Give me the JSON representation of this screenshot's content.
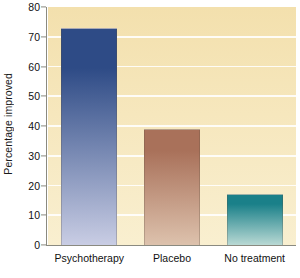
{
  "chart_data": {
    "type": "bar",
    "title": "",
    "xlabel": "",
    "ylabel": "Percentage improved",
    "categories": [
      "Psychotherapy",
      "Placebo",
      "No treatment"
    ],
    "values": [
      73,
      39,
      17
    ],
    "series": [
      {
        "name": "Percentage improved",
        "values": [
          73,
          39,
          17
        ]
      }
    ],
    "ylim": [
      0,
      80
    ],
    "ytick_labels": [
      "0",
      "10",
      "20",
      "30",
      "40",
      "50",
      "60",
      "70",
      "80"
    ],
    "ytick_values": [
      0,
      10,
      20,
      30,
      40,
      50,
      60,
      70,
      80
    ],
    "grid": true,
    "grid_axis": "y",
    "legend": false,
    "legend_position": "none",
    "bar_colors": [
      "#2e4b86",
      "#a9715a",
      "#1a8089"
    ],
    "bar_colors_bottom": [
      "#c9cde4",
      "#ddc2ad",
      "#b9d9d4"
    ],
    "plot_background": "#f5e3b3",
    "gridline_color": "#ffffff",
    "axis_color": "#8a8a80",
    "page_background": "#ffffff",
    "text_color": "#111111"
  }
}
